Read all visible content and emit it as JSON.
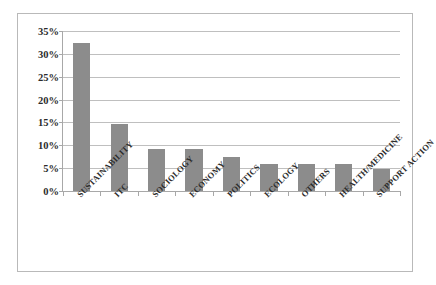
{
  "chart_data": {
    "type": "bar",
    "title": "",
    "subtitle": "",
    "xlabel": "",
    "ylabel": "",
    "categories": [
      "SUSTAINABILITY",
      "ITC",
      "SOCIOLOGY",
      "ECONOMY",
      "POLITICS",
      "ECOLOGY",
      "OTHERS",
      "HEALTH/MEDICINE",
      "SUPPORT ACTION"
    ],
    "values": [
      32.3,
      14.6,
      9.1,
      9.1,
      7.4,
      6.0,
      6.0,
      6.0,
      4.8
    ],
    "value_labels": [
      "",
      "",
      "",
      "",
      "",
      "",
      "",
      "",
      ""
    ],
    "ylim": [
      0,
      35
    ],
    "ytick_values": [
      0,
      5,
      10,
      15,
      20,
      25,
      30,
      35
    ],
    "ytick_labels": [
      "0%",
      "5%",
      "10%",
      "15%",
      "20%",
      "25%",
      "30%",
      "35%"
    ],
    "grid": "horizontal",
    "legend": "none",
    "bar_color": "#8c8c8c",
    "axis_color": "#a8a8a8",
    "gridline_color": "#bfbfbf",
    "frame_color": "#b9b9b9",
    "plot_background": "#ffffff",
    "annotations": []
  }
}
